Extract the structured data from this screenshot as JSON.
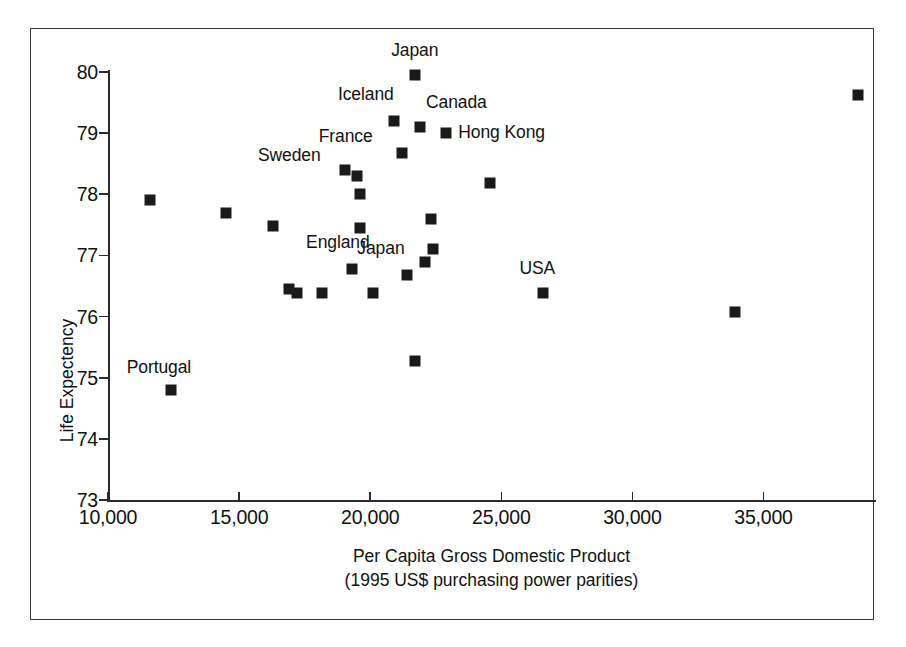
{
  "chart_data": {
    "type": "scatter",
    "title": "",
    "xlabel": "Per Capita Gross Domestic Product",
    "xlabel_line2": "(1995 US$ purchasing power parities)",
    "ylabel": "Life Expectency",
    "xlim": [
      10000,
      39250
    ],
    "ylim": [
      73,
      80
    ],
    "grid": false,
    "legend": "none",
    "xticks": [
      {
        "value": 10000,
        "label": "10,000"
      },
      {
        "value": 15000,
        "label": "15,000"
      },
      {
        "value": 20000,
        "label": "20,000"
      },
      {
        "value": 25000,
        "label": "25,000"
      },
      {
        "value": 30000,
        "label": "30,000"
      },
      {
        "value": 35000,
        "label": "35,000"
      }
    ],
    "yticks": [
      {
        "value": 80,
        "label": "80"
      },
      {
        "value": 79,
        "label": "79"
      },
      {
        "value": 78,
        "label": "78"
      },
      {
        "value": 77,
        "label": "77"
      },
      {
        "value": 76,
        "label": "76"
      },
      {
        "value": 75,
        "label": "75"
      },
      {
        "value": 74,
        "label": "74"
      },
      {
        "value": 73,
        "label": "73"
      }
    ],
    "points": [
      {
        "x": 11600,
        "y": 77.9,
        "label": ""
      },
      {
        "x": 12400,
        "y": 74.8,
        "label": "Portugal",
        "label_dx": -12,
        "label_dy": -22
      },
      {
        "x": 14500,
        "y": 77.7,
        "label": ""
      },
      {
        "x": 16300,
        "y": 77.48,
        "label": ""
      },
      {
        "x": 16900,
        "y": 76.45,
        "label": ""
      },
      {
        "x": 17200,
        "y": 76.38,
        "label": ""
      },
      {
        "x": 18150,
        "y": 76.38,
        "label": ""
      },
      {
        "x": 19050,
        "y": 78.4,
        "label": "Sweden",
        "label_dx": -56,
        "label_dy": -14
      },
      {
        "x": 19300,
        "y": 76.78,
        "label": "England",
        "label_dx": -14,
        "label_dy": -26
      },
      {
        "x": 19500,
        "y": 78.3,
        "label": ""
      },
      {
        "x": 19600,
        "y": 78.0,
        "label": ""
      },
      {
        "x": 19620,
        "y": 77.45,
        "label": ""
      },
      {
        "x": 20100,
        "y": 76.38,
        "label": ""
      },
      {
        "x": 20900,
        "y": 79.2,
        "label": "Iceland",
        "label_dx": -28,
        "label_dy": -26
      },
      {
        "x": 21200,
        "y": 78.67,
        "label": "France",
        "label_dx": -56,
        "label_dy": -16
      },
      {
        "x": 21400,
        "y": 76.68,
        "label": "Japan",
        "label_dx": -26,
        "label_dy": -26
      },
      {
        "x": 21700,
        "y": 79.95,
        "label": "Japan",
        "label_dx": 0,
        "label_dy": -24
      },
      {
        "x": 21700,
        "y": 75.28,
        "label": ""
      },
      {
        "x": 21900,
        "y": 79.1,
        "label": "Canada",
        "label_dx": 6,
        "label_dy": -24
      },
      {
        "x": 22100,
        "y": 76.9,
        "label": ""
      },
      {
        "x": 22300,
        "y": 77.6,
        "label": ""
      },
      {
        "x": 22400,
        "y": 77.1,
        "label": ""
      },
      {
        "x": 22900,
        "y": 79.0,
        "label": "Hong Kong",
        "label_dx": 12,
        "label_dy": 0
      },
      {
        "x": 24550,
        "y": 78.18,
        "label": ""
      },
      {
        "x": 26600,
        "y": 76.38,
        "label": "USA",
        "label_dx": -6,
        "label_dy": -24
      },
      {
        "x": 33900,
        "y": 76.08,
        "label": ""
      },
      {
        "x": 38600,
        "y": 79.63,
        "label": ""
      }
    ]
  },
  "figure": {
    "border_color": "#3a3a3a",
    "marker_color": "#1a1a1a",
    "background": "#ffffff"
  }
}
